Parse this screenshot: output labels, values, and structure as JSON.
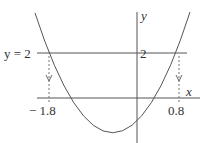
{
  "diagram": {
    "type": "parabola-graph",
    "axes": {
      "x_label": "x",
      "y_label": "y"
    },
    "horizontal_line": {
      "label": "y = 2",
      "y_value": "2"
    },
    "intersections": [
      {
        "x_label": "− 1.8"
      },
      {
        "x_label": "0.8"
      }
    ],
    "colors": {
      "line": "#555555",
      "dashed": "#666666",
      "text": "#333333",
      "background": "#ffffff"
    }
  }
}
